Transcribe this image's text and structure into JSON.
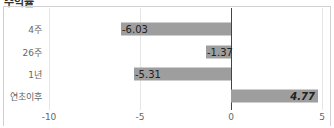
{
  "title": "수익률",
  "colors": {
    "bar": "#9e9e9e",
    "zero_line": "#444444",
    "grid": "#e6e6e6"
  },
  "chart_data": {
    "type": "bar",
    "orientation": "horizontal",
    "title": "수익률",
    "categories": [
      "4주",
      "26주",
      "1년",
      "연초이후"
    ],
    "values": [
      -6.03,
      -1.37,
      -5.31,
      4.77
    ],
    "value_labels": [
      "-6.03",
      "-1.37",
      "-5.31",
      "4.77"
    ],
    "xlabel": "",
    "ylabel": "",
    "xlim": [
      -10,
      5
    ],
    "xticks": [
      -10,
      -5,
      0,
      5
    ],
    "xtick_labels": [
      "-10",
      "-5",
      "0",
      "5"
    ],
    "grid": true,
    "legend": null
  }
}
